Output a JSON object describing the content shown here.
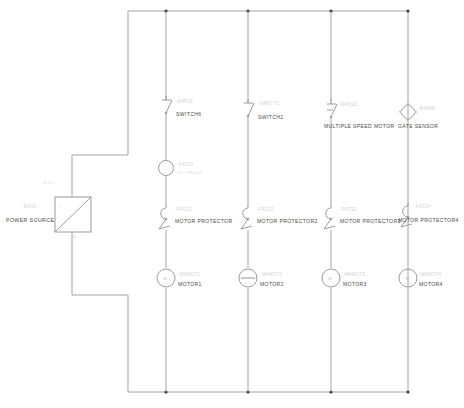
{
  "diagram": {
    "power_source": {
      "label": "POWER SOURCE",
      "ref": "-E4U1",
      "symbol": "power-source-block",
      "terminal_plus": "+",
      "terminal_minus": "-",
      "terminal_bottom": "0"
    },
    "stray_marks": {
      "upper_left": "-E E -"
    },
    "columns": [
      {
        "id": "column-1",
        "components": [
          {
            "kind": "switch",
            "label": "SWITCH6",
            "ref": "-S4P1E"
          },
          {
            "kind": "relay",
            "label": "RLY RELAY",
            "ref": "-K4T21"
          },
          {
            "kind": "motor-protector",
            "label": "MOTOR PROTECTOR",
            "ref": "-F4C21"
          },
          {
            "kind": "motor",
            "label": "MOTOR1",
            "ref": "-M4MOT1"
          }
        ]
      },
      {
        "id": "column-2",
        "components": [
          {
            "kind": "switch",
            "label": "SWITCH2",
            "ref": "-S4P5 T1"
          },
          {
            "kind": "motor-protector",
            "label": "MOTOR PROTECTOR2",
            "ref": "-F4C22"
          },
          {
            "kind": "motor",
            "label": "MOTOR2",
            "ref": "-M4MOT2"
          }
        ]
      },
      {
        "id": "column-3",
        "components": [
          {
            "kind": "multi-speed-motor",
            "label": "MULTIPLE SPEED MOTOR",
            "ref": "-M4H1D"
          },
          {
            "kind": "motor-protector",
            "label": "MOTOR PROTECTOR3",
            "ref": "-F4T32"
          },
          {
            "kind": "motor",
            "label": "MOTOR3",
            "ref": "-M4MOT3"
          }
        ]
      },
      {
        "id": "column-4",
        "components": [
          {
            "kind": "gate-sensor",
            "label": "GATE SENSOR",
            "ref": "-B4N6E"
          },
          {
            "kind": "motor-protector",
            "label": "MOTOR PROTECTOR4",
            "ref": "-F4C24"
          },
          {
            "kind": "motor",
            "label": "MOTOR4",
            "ref": "-M4MOT4"
          }
        ]
      }
    ],
    "colors": {
      "wire": "#9a9a9a",
      "symbol": "#8e8e8e",
      "label_text": "#4a4a4a",
      "ref_text": "#cfcfcf",
      "junction_dot": "#3a3a3a",
      "background": "#ffffff"
    }
  }
}
